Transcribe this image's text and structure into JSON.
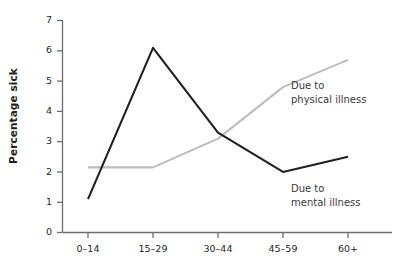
{
  "chart_data": {
    "type": "line",
    "title": "",
    "xlabel": "",
    "ylabel": "Percentage sick",
    "categories": [
      "0–14",
      "15–29",
      "30–44",
      "45–59",
      "60+"
    ],
    "ylim": [
      0,
      7
    ],
    "yticks": [
      "0",
      "1",
      "2",
      "3",
      "4",
      "5",
      "6",
      "7"
    ],
    "grid": false,
    "legend_position": "inline-annotations",
    "series": [
      {
        "name": "Due to mental illness",
        "color": "#231f20",
        "values": [
          1.1,
          6.1,
          3.3,
          2.0,
          2.5
        ]
      },
      {
        "name": "Due to physical illness",
        "color": "#bdbdbd",
        "values": [
          2.15,
          2.15,
          3.1,
          4.8,
          5.7
        ]
      }
    ],
    "annotations": [
      {
        "id": "physical",
        "line1": "Due to",
        "line2": "physical illness"
      },
      {
        "id": "mental",
        "line1": "Due to",
        "line2": "mental illness"
      }
    ]
  },
  "axis": {
    "y_label": "Percentage sick",
    "y_ticks": [
      "7",
      "6",
      "5",
      "4",
      "3",
      "2",
      "1",
      "0"
    ],
    "x_ticks": [
      "0–14",
      "15–29",
      "30–44",
      "45–59",
      "60+"
    ]
  },
  "colors": {
    "mental_line": "#231f20",
    "physical_line": "#bdbdbd",
    "axis": "#6d6e71",
    "text": "#231f20",
    "annotation_text": "#3a3a3a"
  }
}
